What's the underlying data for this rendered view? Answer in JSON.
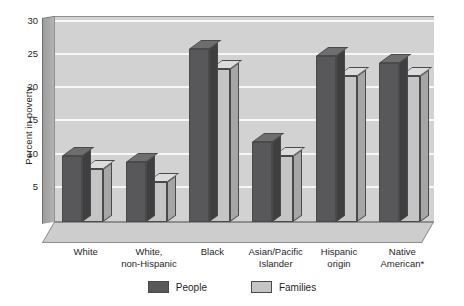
{
  "chart_data": {
    "type": "bar",
    "title": "",
    "xlabel": "",
    "ylabel": "Percent in poverty",
    "ylim": [
      0,
      31
    ],
    "yticks": [
      5,
      10,
      15,
      20,
      25,
      30
    ],
    "ytick_labels": [
      "5",
      "10",
      "15",
      "20",
      "25",
      "30"
    ],
    "grid": true,
    "legend_position": "bottom",
    "style": "3d-grouped-bar-grayscale",
    "categories": [
      "White",
      "White,\nnon-Hispanic",
      "Black",
      "Asian/Pacific\nIslander",
      "Hispanic\norigin",
      "Native\nAmerican*"
    ],
    "category_lines": [
      [
        "White"
      ],
      [
        "White,",
        "non-Hispanic"
      ],
      [
        "Black"
      ],
      [
        "Asian/Pacific",
        "Islander"
      ],
      [
        "Hispanic",
        "origin"
      ],
      [
        "Native",
        "American*"
      ]
    ],
    "series": [
      {
        "name": "People",
        "color": "#58585a",
        "values": [
          10,
          9,
          26,
          12,
          25,
          24
        ]
      },
      {
        "name": "Families",
        "color": "#c5c5c5",
        "values": [
          8,
          6,
          23,
          10,
          22,
          22
        ]
      }
    ]
  },
  "legend": {
    "items": [
      {
        "label": "People",
        "color": "#58585a"
      },
      {
        "label": "Families",
        "color": "#c5c5c5"
      }
    ]
  },
  "colors": {
    "plot_background": "#d2d2d2",
    "gridline": "#f7f7f7",
    "axis_wall": "#a8a8a8",
    "floor": "#cdcdcd",
    "outline": "#4a4a4a",
    "text": "#1f1f1f"
  }
}
